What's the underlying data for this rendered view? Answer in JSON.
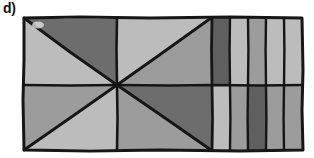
{
  "figure": {
    "label": "d)",
    "caption_label": "d)",
    "type": "geometric-partition-diagram",
    "canvas": {
      "width": 314,
      "height": 158,
      "background": "#ffffff"
    }
  },
  "palette": {
    "light_gray": "#bcbcbc",
    "mid_gray": "#9c9c9c",
    "dark_gray": "#6d6d6d",
    "darkest_gray": "#5a5a5a",
    "stroke": "#161616",
    "background": "#ffffff"
  },
  "geometry": {
    "outer_rect": {
      "x": 23,
      "y": 17,
      "width": 280,
      "height": 134
    },
    "midline_y": 85,
    "divider_x_left_mid": 117,
    "divider_x_mid_stripes": 212,
    "left_square": {
      "x": 23,
      "y": 17,
      "width": 94,
      "height": 134,
      "apex_x": 117,
      "apex_y": 85
    },
    "mid_square": {
      "x": 117,
      "y": 17,
      "width": 95,
      "height": 134,
      "apex_x": 117,
      "apex_y": 85
    },
    "stripe_band": {
      "x": 212,
      "y": 17,
      "width": 91,
      "height": 134
    },
    "stripe_edges": [
      212,
      230,
      248,
      266,
      284,
      303
    ]
  },
  "regions": {
    "left_square": [
      {
        "name": "left-top-triangle",
        "fill_key": "light_gray",
        "fill": "#bcbcbc"
      },
      {
        "name": "left-upper-right-triangle",
        "fill_key": "dark_gray",
        "fill": "#6d6d6d"
      },
      {
        "name": "left-lower-left-triangle",
        "fill_key": "mid_gray",
        "fill": "#9c9c9c"
      },
      {
        "name": "left-bottom-triangle",
        "fill_key": "light_gray",
        "fill": "#bcbcbc"
      }
    ],
    "mid_square": [
      {
        "name": "mid-top-triangle",
        "fill_key": "light_gray",
        "fill": "#bcbcbc"
      },
      {
        "name": "mid-right-upper-triangle",
        "fill_key": "mid_gray",
        "fill": "#9c9c9c"
      },
      {
        "name": "mid-left-lower-triangle",
        "fill_key": "mid_gray",
        "fill": "#9c9c9c"
      },
      {
        "name": "mid-bottom-right-triangle",
        "fill_key": "dark_gray",
        "fill": "#6d6d6d"
      }
    ],
    "stripes_top": [
      {
        "name": "stripe-top-1",
        "fill_key": "darkest_gray",
        "fill": "#5f5f5f"
      },
      {
        "name": "stripe-top-2",
        "fill_key": "light_gray",
        "fill": "#bcbcbc"
      },
      {
        "name": "stripe-top-3",
        "fill_key": "mid_gray",
        "fill": "#9c9c9c"
      },
      {
        "name": "stripe-top-4",
        "fill_key": "light_gray",
        "fill": "#bcbcbc"
      },
      {
        "name": "stripe-top-5",
        "fill_key": "light_gray",
        "fill": "#bcbcbc"
      }
    ],
    "stripes_bottom": [
      {
        "name": "stripe-bottom-1",
        "fill_key": "light_gray",
        "fill": "#bcbcbc"
      },
      {
        "name": "stripe-bottom-2",
        "fill_key": "mid_gray",
        "fill": "#9c9c9c"
      },
      {
        "name": "stripe-bottom-3",
        "fill_key": "darkest_gray",
        "fill": "#5f5f5f"
      },
      {
        "name": "stripe-bottom-4",
        "fill_key": "mid_gray",
        "fill": "#9c9c9c"
      },
      {
        "name": "stripe-bottom-5",
        "fill_key": "mid_gray",
        "fill": "#9c9c9c"
      }
    ]
  }
}
